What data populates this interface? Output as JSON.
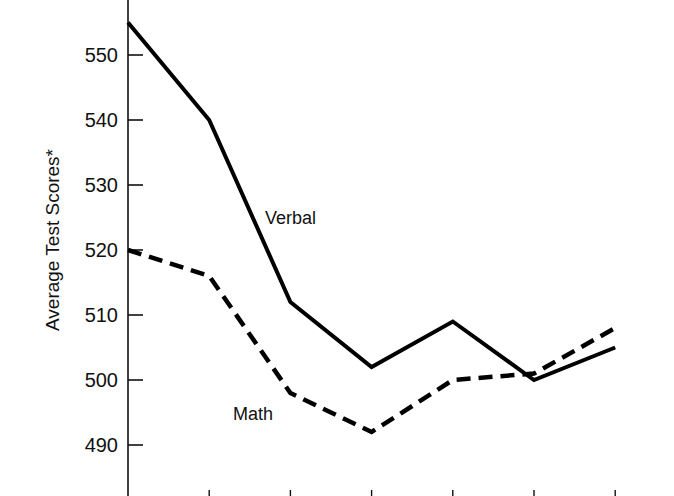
{
  "chart_data": {
    "type": "line",
    "title": "",
    "xlabel": "",
    "ylabel": "Average Test Scores*",
    "x": [
      0,
      1,
      2,
      3,
      4,
      5,
      6
    ],
    "x_tick_labels": [],
    "yticks": [
      490,
      500,
      510,
      520,
      530,
      540,
      550
    ],
    "ylim": [
      481,
      560
    ],
    "grid": false,
    "legend": "inline labels",
    "series": [
      {
        "name": "Verbal",
        "style": "solid",
        "values": [
          555,
          540,
          512,
          502,
          509,
          500,
          505
        ]
      },
      {
        "name": "Math",
        "style": "dashed",
        "values": [
          520,
          516,
          498,
          492,
          500,
          501,
          508
        ]
      }
    ],
    "annotations": [
      {
        "text": "Verbal",
        "near_x_index": 2
      },
      {
        "text": "Math",
        "near_x_index": 2
      }
    ]
  },
  "colors": {
    "line": "#000000",
    "axis": "#111111",
    "background": "#ffffff"
  }
}
